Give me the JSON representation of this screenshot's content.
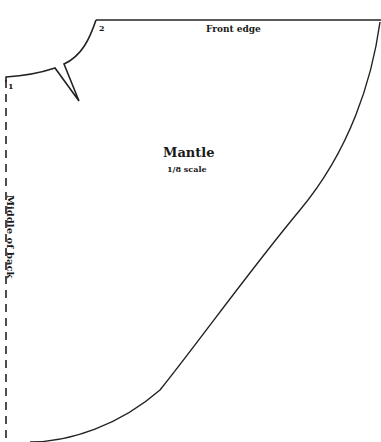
{
  "pattern": {
    "title": "Mantle",
    "scale": "1/8 scale",
    "edges": {
      "front": "Front edge",
      "back": "Middle of back"
    },
    "points": {
      "p1": "1",
      "p2": "2"
    },
    "colors": {
      "line": "#222222",
      "background": "#ffffff"
    }
  }
}
